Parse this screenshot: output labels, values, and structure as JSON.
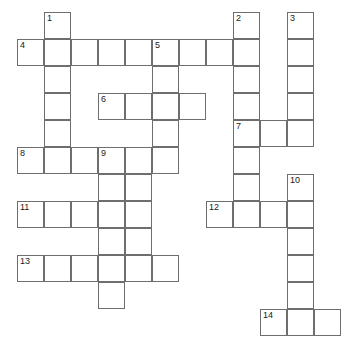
{
  "puzzle": {
    "kind": "crossword-grid",
    "title": "",
    "grid": {
      "origin_x": 17,
      "origin_y": 12,
      "cell_size": 27,
      "columns": 13,
      "rows": 12,
      "border_color": "#6e6e6e",
      "cell_fill": "#ffffff",
      "number_color": "#1a1a1a",
      "background": "#ffffff"
    },
    "clue_numbers": [
      "1",
      "2",
      "3",
      "4",
      "5",
      "6",
      "7",
      "8",
      "9",
      "10",
      "11",
      "12",
      "13",
      "14"
    ],
    "entries": [
      {
        "number": "1",
        "direction": "down",
        "col": 1,
        "row": 0,
        "length": 6
      },
      {
        "number": "2",
        "direction": "down",
        "col": 8,
        "row": 0,
        "length": 8
      },
      {
        "number": "3",
        "direction": "down",
        "col": 10,
        "row": 0,
        "length": 5
      },
      {
        "number": "4",
        "direction": "across",
        "col": 0,
        "row": 1,
        "length": 9
      },
      {
        "number": "5",
        "direction": "down",
        "col": 5,
        "row": 1,
        "length": 5
      },
      {
        "number": "6",
        "direction": "across",
        "col": 3,
        "row": 3,
        "length": 4
      },
      {
        "number": "7",
        "direction": "across",
        "col": 8,
        "row": 4,
        "length": 3
      },
      {
        "number": "8",
        "direction": "across",
        "col": 0,
        "row": 5,
        "length": 4
      },
      {
        "number": "9",
        "direction": "down",
        "col": 3,
        "row": 5,
        "length": 7
      },
      {
        "number": "10",
        "direction": "down",
        "col": 10,
        "row": 6,
        "length": 6
      },
      {
        "number": "11",
        "direction": "across",
        "col": 0,
        "row": 7,
        "length": 5
      },
      {
        "number": "12",
        "direction": "across",
        "col": 7,
        "row": 7,
        "length": 4
      },
      {
        "number": "13",
        "direction": "across",
        "col": 0,
        "row": 9,
        "length": 6
      },
      {
        "number": "14",
        "direction": "across",
        "col": 9,
        "row": 11,
        "length": 3
      }
    ],
    "cells": [
      {
        "col": 1,
        "row": 0,
        "number": "1",
        "letter": ""
      },
      {
        "col": 8,
        "row": 0,
        "number": "2",
        "letter": ""
      },
      {
        "col": 10,
        "row": 0,
        "number": "3",
        "letter": ""
      },
      {
        "col": 0,
        "row": 1,
        "number": "4",
        "letter": ""
      },
      {
        "col": 1,
        "row": 1,
        "number": "",
        "letter": ""
      },
      {
        "col": 2,
        "row": 1,
        "number": "",
        "letter": ""
      },
      {
        "col": 3,
        "row": 1,
        "number": "",
        "letter": ""
      },
      {
        "col": 4,
        "row": 1,
        "number": "",
        "letter": ""
      },
      {
        "col": 5,
        "row": 1,
        "number": "5",
        "letter": ""
      },
      {
        "col": 6,
        "row": 1,
        "number": "",
        "letter": ""
      },
      {
        "col": 7,
        "row": 1,
        "number": "",
        "letter": ""
      },
      {
        "col": 8,
        "row": 1,
        "number": "",
        "letter": ""
      },
      {
        "col": 10,
        "row": 1,
        "number": "",
        "letter": ""
      },
      {
        "col": 1,
        "row": 2,
        "number": "",
        "letter": ""
      },
      {
        "col": 5,
        "row": 2,
        "number": "",
        "letter": ""
      },
      {
        "col": 8,
        "row": 2,
        "number": "",
        "letter": ""
      },
      {
        "col": 10,
        "row": 2,
        "number": "",
        "letter": ""
      },
      {
        "col": 1,
        "row": 3,
        "number": "",
        "letter": ""
      },
      {
        "col": 3,
        "row": 3,
        "number": "6",
        "letter": ""
      },
      {
        "col": 4,
        "row": 3,
        "number": "",
        "letter": ""
      },
      {
        "col": 5,
        "row": 3,
        "number": "",
        "letter": ""
      },
      {
        "col": 6,
        "row": 3,
        "number": "",
        "letter": ""
      },
      {
        "col": 8,
        "row": 3,
        "number": "",
        "letter": ""
      },
      {
        "col": 10,
        "row": 3,
        "number": "",
        "letter": ""
      },
      {
        "col": 1,
        "row": 4,
        "number": "",
        "letter": ""
      },
      {
        "col": 5,
        "row": 4,
        "number": "",
        "letter": ""
      },
      {
        "col": 8,
        "row": 4,
        "number": "7",
        "letter": ""
      },
      {
        "col": 9,
        "row": 4,
        "number": "",
        "letter": ""
      },
      {
        "col": 10,
        "row": 4,
        "number": "",
        "letter": ""
      },
      {
        "col": 0,
        "row": 5,
        "number": "8",
        "letter": ""
      },
      {
        "col": 1,
        "row": 5,
        "number": "",
        "letter": ""
      },
      {
        "col": 2,
        "row": 5,
        "number": "",
        "letter": ""
      },
      {
        "col": 3,
        "row": 5,
        "number": "9",
        "letter": ""
      },
      {
        "col": 4,
        "row": 5,
        "number": "",
        "letter": ""
      },
      {
        "col": 5,
        "row": 5,
        "number": "",
        "letter": ""
      },
      {
        "col": 8,
        "row": 5,
        "number": "",
        "letter": ""
      },
      {
        "col": 3,
        "row": 6,
        "number": "",
        "letter": ""
      },
      {
        "col": 4,
        "row": 6,
        "number": "",
        "letter": ""
      },
      {
        "col": 8,
        "row": 6,
        "number": "",
        "letter": ""
      },
      {
        "col": 10,
        "row": 6,
        "number": "10",
        "letter": ""
      },
      {
        "col": 0,
        "row": 7,
        "number": "11",
        "letter": ""
      },
      {
        "col": 1,
        "row": 7,
        "number": "",
        "letter": ""
      },
      {
        "col": 2,
        "row": 7,
        "number": "",
        "letter": ""
      },
      {
        "col": 3,
        "row": 7,
        "number": "",
        "letter": ""
      },
      {
        "col": 4,
        "row": 7,
        "number": "",
        "letter": ""
      },
      {
        "col": 7,
        "row": 7,
        "number": "12",
        "letter": ""
      },
      {
        "col": 8,
        "row": 7,
        "number": "",
        "letter": ""
      },
      {
        "col": 9,
        "row": 7,
        "number": "",
        "letter": ""
      },
      {
        "col": 10,
        "row": 7,
        "number": "",
        "letter": ""
      },
      {
        "col": 3,
        "row": 8,
        "number": "",
        "letter": ""
      },
      {
        "col": 4,
        "row": 8,
        "number": "",
        "letter": ""
      },
      {
        "col": 10,
        "row": 8,
        "number": "",
        "letter": ""
      },
      {
        "col": 0,
        "row": 9,
        "number": "13",
        "letter": ""
      },
      {
        "col": 1,
        "row": 9,
        "number": "",
        "letter": ""
      },
      {
        "col": 2,
        "row": 9,
        "number": "",
        "letter": ""
      },
      {
        "col": 3,
        "row": 9,
        "number": "",
        "letter": ""
      },
      {
        "col": 4,
        "row": 9,
        "number": "",
        "letter": ""
      },
      {
        "col": 5,
        "row": 9,
        "number": "",
        "letter": ""
      },
      {
        "col": 10,
        "row": 9,
        "number": "",
        "letter": ""
      },
      {
        "col": 3,
        "row": 10,
        "number": "",
        "letter": ""
      },
      {
        "col": 10,
        "row": 10,
        "number": "",
        "letter": ""
      },
      {
        "col": 9,
        "row": 11,
        "number": "14",
        "letter": ""
      },
      {
        "col": 10,
        "row": 11,
        "number": "",
        "letter": ""
      },
      {
        "col": 11,
        "row": 11,
        "number": "",
        "letter": ""
      }
    ]
  }
}
